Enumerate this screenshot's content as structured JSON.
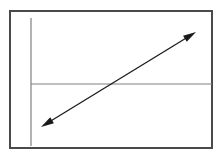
{
  "figure": {
    "background_color": "#ffffff",
    "frame": {
      "label": "diagram-border",
      "x": 10,
      "y": 11,
      "width": 202,
      "height": 137,
      "stroke_color": "#4a4a4a",
      "stroke_width": 2
    }
  },
  "chart_data": {
    "type": "line",
    "title": "",
    "subtitle": "",
    "xlabel": "",
    "ylabel": "",
    "grid": false,
    "legend": null,
    "axis_color": "#808080",
    "axis_stroke_width": 1.2,
    "arrow_color": "#1a1a1a",
    "arrow_stroke_width": 1.3,
    "xlim": [
      0,
      221
    ],
    "ylim": [
      0,
      159
    ],
    "axes": [
      {
        "name": "vertical-axis",
        "orientation": "vertical",
        "x1": 31,
        "y1": 18,
        "x2": 31,
        "y2": 146
      },
      {
        "name": "horizontal-axis",
        "orientation": "horizontal",
        "x1": 31,
        "y1": 84,
        "x2": 212,
        "y2": 84
      }
    ],
    "series": [
      {
        "name": "diagonal-double-arrow",
        "style": "double-headed-arrow",
        "x": [
          41,
          196
        ],
        "y": [
          127,
          32
        ],
        "start_point": {
          "x": 41,
          "y": 127
        },
        "end_point": {
          "x": 196,
          "y": 32
        },
        "intersection_with_horizontal_axis": {
          "x": 115,
          "y": 84
        },
        "slope": -0.613,
        "direction": "rising left-to-right",
        "arrowheads": [
          "start",
          "end"
        ],
        "arrowhead_length": 13,
        "arrowhead_width": 7
      }
    ],
    "annotations": []
  }
}
